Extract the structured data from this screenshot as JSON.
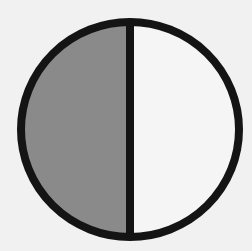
{
  "figure": {
    "fraction_shaded": "1/2",
    "parts_total": 2,
    "parts_shaded": 1,
    "shaded_side": "left"
  },
  "geometry": {
    "center_x": 130,
    "center_y": 129.5,
    "radius_x": 109,
    "radius_y": 107.5,
    "stroke_width": 8,
    "divider_x": 130
  },
  "colors": {
    "background": "#f1f1f1",
    "shaded_fill": "#8a8a8a",
    "unshaded_fill": "#f5f5f5",
    "stroke": "#141414"
  }
}
